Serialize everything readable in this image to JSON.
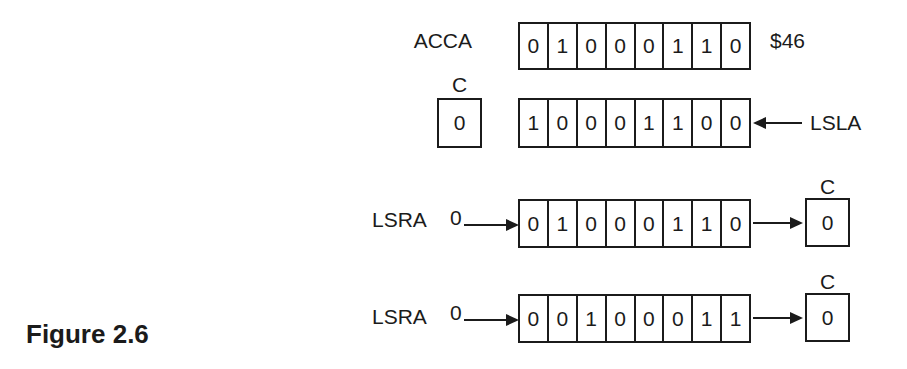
{
  "figure": {
    "caption": "Figure 2.6"
  },
  "colors": {
    "ink": "#1b1b1b",
    "paper": "#ffffff"
  },
  "acca": {
    "label": "ACCA",
    "bits": [
      "0",
      "1",
      "0",
      "0",
      "0",
      "1",
      "1",
      "0"
    ],
    "hex_value": "$46"
  },
  "lsla": {
    "label": "LSLA",
    "carry": {
      "label": "C",
      "value": "0"
    },
    "bits": [
      "1",
      "0",
      "0",
      "0",
      "1",
      "1",
      "0",
      "0"
    ]
  },
  "lsra_first": {
    "label": "LSRA",
    "shift_in": "0",
    "bits": [
      "0",
      "1",
      "0",
      "0",
      "0",
      "1",
      "1",
      "0"
    ],
    "carry": {
      "label": "C",
      "value": "0"
    }
  },
  "lsra_second": {
    "label": "LSRA",
    "shift_in": "0",
    "bits": [
      "0",
      "0",
      "1",
      "0",
      "0",
      "0",
      "1",
      "1"
    ],
    "carry": {
      "label": "C",
      "value": "0"
    }
  }
}
